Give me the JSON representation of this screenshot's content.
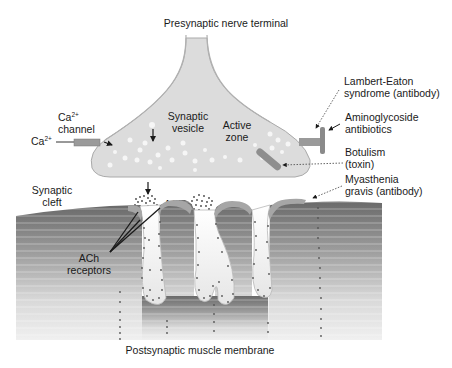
{
  "diagram": {
    "labels": {
      "presynaptic": "Presynaptic nerve terminal",
      "ca_channel_line1": "Ca",
      "ca_channel_sup": "2+",
      "ca_channel_line2": "channel",
      "ca_ion": "Ca",
      "ca_ion_sup": "2+",
      "synaptic_vesicle_line1": "Synaptic",
      "synaptic_vesicle_line2": "vesicle",
      "active_zone_line1": "Active",
      "active_zone_line2": "zone",
      "ach": "ACh",
      "synaptic_cleft_line1": "Synaptic",
      "synaptic_cleft_line2": "cleft",
      "ach_receptors_line1": "ACh",
      "ach_receptors_line2": "receptors",
      "postsynaptic": "Postsynaptic muscle membrane"
    },
    "annotations": [
      {
        "line1": "Lambert-Eaton",
        "line2": "syndrome (antibody)",
        "target": "presynaptic Ca2+ channel"
      },
      {
        "line1": "Aminoglycoside",
        "line2": "antibiotics",
        "target": "presynaptic Ca2+ channel"
      },
      {
        "line1": "Botulism",
        "line2": "(toxin)",
        "target": "vesicle release machinery"
      },
      {
        "line1": "Myasthenia",
        "line2": "gravis (antibody)",
        "target": "ACh receptors"
      }
    ],
    "colors": {
      "terminal_fill": "#dcdcdc",
      "terminal_edge": "#9a9a9a",
      "channel": "#8e8e8e",
      "muscle_dark": "#6e6e6e",
      "muscle_light": "#f2f2f2",
      "receptor_cap": "#a8a8a8",
      "dots": "#555555",
      "text": "#1a1a1a"
    }
  }
}
